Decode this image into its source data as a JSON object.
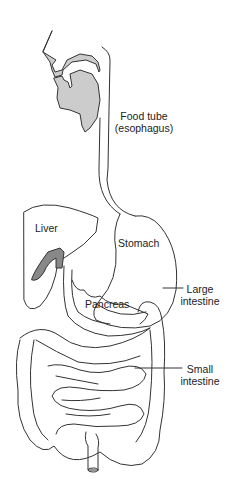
{
  "diagram": {
    "colors": {
      "stroke": "#333333",
      "fill_light": "#cccccc",
      "fill_dark": "#888888",
      "background": "#ffffff"
    },
    "labels": {
      "food_tube_1": "Food tube",
      "food_tube_2": "(esophagus)",
      "liver": "Liver",
      "stomach": "Stomach",
      "pancreas": "Pancreas",
      "large_intestine_1": "Large",
      "large_intestine_2": "intestine",
      "small_intestine_1": "Small",
      "small_intestine_2": "intestine"
    }
  }
}
